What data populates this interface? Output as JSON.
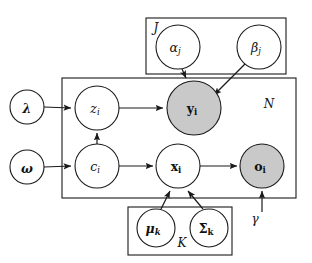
{
  "figure": {
    "kind": "probabilistic-graphical-model",
    "title": "",
    "background_color": "#ffffff",
    "stroke_color": "#1a1a1a",
    "shaded_node_color": "#c9c9c9",
    "unshaded_node_color": "#ffffff"
  },
  "plates": [
    {
      "id": "plate-j",
      "label": "J",
      "label_position": "top-left",
      "x": 146,
      "y": 18,
      "width": 140,
      "height": 56
    },
    {
      "id": "plate-n",
      "label": "N",
      "label_position": "top-right",
      "x": 62,
      "y": 78,
      "width": 234,
      "height": 120
    },
    {
      "id": "plate-k",
      "label": "K",
      "label_position": "bottom-center",
      "x": 128,
      "y": 207,
      "width": 104,
      "height": 48
    }
  ],
  "nodes": [
    {
      "id": "lambda",
      "label": "λ",
      "sub": "",
      "cx": 27,
      "cy": 107,
      "r": 17,
      "shaded": false,
      "bold": true,
      "italic": true
    },
    {
      "id": "omega",
      "label": "ω",
      "sub": "",
      "cx": 27,
      "cy": 167,
      "r": 17,
      "shaded": false,
      "bold": true,
      "italic": true
    },
    {
      "id": "alpha_j",
      "label": "α",
      "sub": "j",
      "cx": 178,
      "cy": 47,
      "r": 22,
      "shaded": false,
      "bold": false,
      "italic": true
    },
    {
      "id": "beta_j",
      "label": "β",
      "sub": "j",
      "cx": 259,
      "cy": 47,
      "r": 22,
      "shaded": false,
      "bold": false,
      "italic": true
    },
    {
      "id": "z_i",
      "label": "z",
      "sub": "i",
      "cx": 97,
      "cy": 108,
      "r": 22,
      "shaded": false,
      "bold": false,
      "italic": true
    },
    {
      "id": "y_i",
      "label": "y",
      "sub": "i",
      "cx": 194,
      "cy": 108,
      "r": 27,
      "shaded": true,
      "bold": true,
      "italic": false
    },
    {
      "id": "c_i",
      "label": "c",
      "sub": "i",
      "cx": 97,
      "cy": 166,
      "r": 22,
      "shaded": false,
      "bold": false,
      "italic": true
    },
    {
      "id": "x_i",
      "label": "x",
      "sub": "i",
      "cx": 178,
      "cy": 166,
      "r": 22,
      "shaded": false,
      "bold": true,
      "italic": false
    },
    {
      "id": "o_i",
      "label": "o",
      "sub": "i",
      "cx": 262,
      "cy": 166,
      "r": 22,
      "shaded": true,
      "bold": true,
      "italic": false
    },
    {
      "id": "mu_k",
      "label": "μ",
      "sub": "k",
      "cx": 156,
      "cy": 228,
      "r": 19,
      "shaded": false,
      "bold": true,
      "italic": true
    },
    {
      "id": "sigma_k",
      "label": "Σ",
      "sub": "k",
      "cx": 209,
      "cy": 228,
      "r": 19,
      "shaded": false,
      "bold": true,
      "italic": false
    }
  ],
  "free_labels": [
    {
      "id": "gamma",
      "label": "γ",
      "x": 255,
      "y": 219
    }
  ],
  "edges": [
    {
      "id": "lambda-to-z",
      "from": "lambda",
      "to": "z_i"
    },
    {
      "id": "omega-to-c",
      "from": "omega",
      "to": "c_i"
    },
    {
      "id": "c-to-z",
      "from": "c_i",
      "to": "z_i"
    },
    {
      "id": "z-to-y",
      "from": "z_i",
      "to": "y_i"
    },
    {
      "id": "c-to-x",
      "from": "c_i",
      "to": "x_i"
    },
    {
      "id": "x-to-o",
      "from": "x_i",
      "to": "o_i"
    },
    {
      "id": "alpha-to-y",
      "from": "alpha_j",
      "to": "y_i"
    },
    {
      "id": "beta-to-y",
      "from": "beta_j",
      "to": "y_i"
    },
    {
      "id": "mu-to-x",
      "from": "mu_k",
      "to": "x_i"
    },
    {
      "id": "sigma-to-x",
      "from": "sigma_k",
      "to": "x_i"
    },
    {
      "id": "gamma-to-o",
      "from": "gamma",
      "to": "o_i"
    }
  ]
}
